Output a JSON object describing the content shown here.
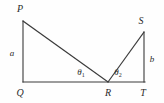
{
  "figure": {
    "type": "geometry-diagram",
    "canvas": {
      "width": 164,
      "height": 103,
      "background": "#fefefe"
    },
    "stroke_color": "#3a3a3a",
    "text_color": "#2b2b2b",
    "vertices": [
      {
        "id": "P",
        "label": "P",
        "x": 23,
        "y": 21,
        "label_x": 20,
        "label_y": 9
      },
      {
        "id": "Q",
        "label": "Q",
        "x": 23,
        "y": 82,
        "label_x": 20,
        "label_y": 93
      },
      {
        "id": "R",
        "label": "R",
        "x": 108,
        "y": 82,
        "label_x": 108,
        "label_y": 93
      },
      {
        "id": "T",
        "label": "T",
        "x": 144,
        "y": 82,
        "label_x": 143,
        "label_y": 93
      },
      {
        "id": "S",
        "label": "S",
        "x": 144,
        "y": 32,
        "label_x": 141,
        "label_y": 21
      }
    ],
    "segments": [
      {
        "id": "PQ",
        "from": "P",
        "to": "Q",
        "x1": 23,
        "y1": 21,
        "x2": 23,
        "y2": 82
      },
      {
        "id": "QT",
        "from": "Q",
        "to": "T",
        "x1": 23,
        "y1": 82,
        "x2": 145,
        "y2": 82
      },
      {
        "id": "PR",
        "from": "P",
        "to": "R",
        "x1": 23,
        "y1": 21,
        "x2": 108,
        "y2": 82
      },
      {
        "id": "RS",
        "from": "R",
        "to": "S",
        "x1": 108,
        "y1": 82,
        "x2": 144,
        "y2": 32
      },
      {
        "id": "ST",
        "from": "S",
        "to": "T",
        "x1": 144,
        "y1": 32,
        "x2": 144,
        "y2": 82
      }
    ],
    "side_labels": [
      {
        "id": "a",
        "label": "a",
        "segment": "PQ",
        "x": 12,
        "y": 53
      },
      {
        "id": "b",
        "label": "b",
        "segment": "ST",
        "x": 152,
        "y": 59
      }
    ],
    "angle_labels": [
      {
        "id": "theta1",
        "symbol": "θ",
        "subscript": "1",
        "vertex": "R",
        "x": 81,
        "y": 73
      },
      {
        "id": "theta2",
        "symbol": "θ",
        "subscript": "2",
        "vertex": "R",
        "x": 118,
        "y": 73
      }
    ]
  }
}
